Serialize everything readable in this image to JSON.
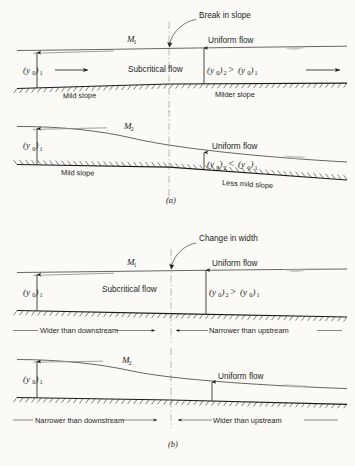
{
  "figure": {
    "captions": [
      {
        "key": "a",
        "text": "(a)"
      },
      {
        "key": "b",
        "text": "(b)"
      }
    ]
  },
  "panels": [
    {
      "id": "panel-a-top",
      "group": "a",
      "profile_label": "M",
      "profile_sub": "1",
      "transition_label": "Change in slope",
      "transition_label_actual": "Break in slope",
      "uniform_flow_label": "Uniform flow",
      "flow_regime_label": "Subcritical flow",
      "depth_upstream": {
        "base": "(y",
        "sub": "0",
        "close": ")",
        "index": "1"
      },
      "depth_downstream_relation": {
        "left_base": "(y",
        "left_sub": "0",
        "left_close": ")",
        "left_index": "2",
        "relation": ">",
        "right_base": "(y",
        "right_sub": "0",
        "right_close": ")",
        "right_index": "1"
      },
      "bed_label_left": "Mild slope",
      "bed_label_right": "Milder slope",
      "flow_arrows": 2
    },
    {
      "id": "panel-a-bottom",
      "group": "a",
      "profile_label": "M",
      "profile_sub": "2",
      "uniform_flow_label": "Uniform flow",
      "depth_upstream": {
        "base": "(y",
        "sub": "0",
        "close": ")",
        "index": "1"
      },
      "depth_downstream_relation": {
        "left_base": "(y",
        "left_sub": "0",
        "left_close": ")",
        "left_index": "2",
        "relation": "<",
        "right_base": "(y",
        "right_sub": "0",
        "right_close": ")",
        "right_index": "1"
      },
      "bed_label_left": "Mild slope",
      "bed_label_right": "Less mild slope",
      "flow_arrows": 0
    },
    {
      "id": "panel-b-top",
      "group": "b",
      "profile_label": "M",
      "profile_sub": "1",
      "transition_label": "Change in width",
      "uniform_flow_label": "Uniform flow",
      "flow_regime_label": "Subcritical flow",
      "depth_upstream": {
        "base": "(y",
        "sub": "0",
        "close": ")",
        "index": "1"
      },
      "depth_downstream_relation": {
        "left_base": "(y",
        "left_sub": "0",
        "left_close": ")",
        "left_index": "2",
        "relation": ">",
        "right_base": "(y",
        "right_sub": "0",
        "right_close": ")",
        "right_index": "1"
      },
      "width_label_left": "Wider than downstream",
      "width_label_right": "Narrower than upstream",
      "flow_arrows": 0
    },
    {
      "id": "panel-b-bottom",
      "group": "b",
      "profile_label": "M",
      "profile_sub": "2",
      "uniform_flow_label": "Uniform flow",
      "depth_upstream": {
        "base": "(y",
        "sub": "0",
        "close": ")",
        "index": "1"
      },
      "width_label_left": "Narrower than downstream",
      "width_label_right": "Wider than upstream",
      "flow_arrows": 0
    }
  ],
  "colors": {
    "bed": "#1a1a1a",
    "water_surface": "#4a4a4a",
    "centerline": "#9a9a9a",
    "text": "#1d1d1d",
    "background": "#fbfaf7"
  }
}
